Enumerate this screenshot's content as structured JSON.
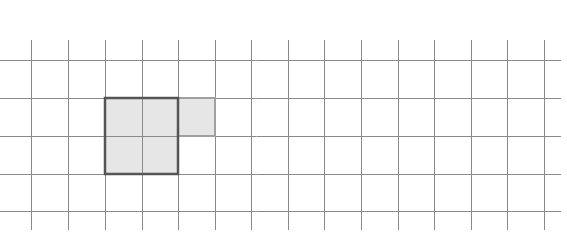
{
  "diagram": {
    "type": "grid-shape",
    "canvas": {
      "width": 567,
      "height": 249,
      "background": "#ffffff"
    },
    "grid": {
      "vertical_lines_x": [
        31,
        68,
        105,
        142,
        178,
        215,
        251,
        288,
        324,
        361,
        398,
        434,
        471,
        507,
        544
      ],
      "vertical_span_y": [
        40,
        230
      ],
      "horizontal_lines_y": [
        60,
        98,
        136,
        174,
        211
      ],
      "horizontal_span_x": [
        0,
        561
      ],
      "line_color": "#8a8a8a",
      "line_width": 1
    },
    "shape": {
      "description": "Shaded polyomino of 5 unit squares: a 2x2 block plus one extra square to the right of the top row",
      "fill_color": "#e6e6e6",
      "cells": [
        {
          "col": 2,
          "row": 1
        },
        {
          "col": 3,
          "row": 1
        },
        {
          "col": 4,
          "row": 1
        },
        {
          "col": 2,
          "row": 2
        },
        {
          "col": 3,
          "row": 2
        }
      ],
      "bold_outline": {
        "color": "#555555",
        "width": 2.5,
        "rect": {
          "x1": 105,
          "y1": 98,
          "x2": 178,
          "y2": 174
        }
      },
      "extra_cell_outline": {
        "color": "#a0a0a0",
        "width": 2,
        "rect": {
          "x1": 178,
          "y1": 98,
          "x2": 215,
          "y2": 136
        }
      }
    }
  }
}
